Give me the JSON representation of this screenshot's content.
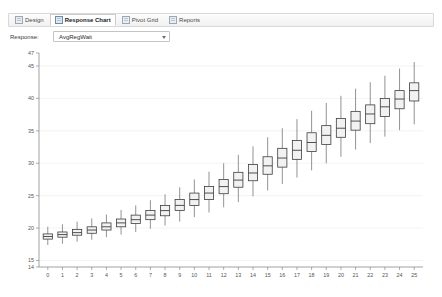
{
  "window": {
    "tabs": [
      {
        "label": "Design",
        "icon": "design-icon",
        "active": false
      },
      {
        "label": "Response Chart",
        "icon": "chart-icon",
        "active": true
      },
      {
        "label": "Pivot Grid",
        "icon": "grid-icon",
        "active": false
      },
      {
        "label": "Reports",
        "icon": "report-icon",
        "active": false
      }
    ]
  },
  "controls": {
    "response_label": "Response:",
    "response_value": "AvgRegWait",
    "dropdown_icon": "chevron-down-icon"
  },
  "chart_data": {
    "type": "box",
    "title": "",
    "xlabel": "",
    "ylabel": "",
    "xlim": [
      -0.6,
      25.6
    ],
    "ylim": [
      14,
      47
    ],
    "grid": true,
    "legend": "none",
    "y_ticks": [
      14,
      15,
      20,
      25,
      30,
      35,
      40,
      45,
      47
    ],
    "y_major_ticks": [
      15,
      20,
      25,
      30,
      35,
      40,
      45
    ],
    "x_ticks": [
      0,
      1,
      2,
      3,
      4,
      5,
      6,
      7,
      8,
      9,
      10,
      11,
      12,
      13,
      14,
      15,
      16,
      17,
      18,
      19,
      20,
      21,
      22,
      23,
      24,
      25
    ],
    "categories": [
      "0",
      "1",
      "2",
      "3",
      "4",
      "5",
      "6",
      "7",
      "8",
      "9",
      "10",
      "11",
      "12",
      "13",
      "14",
      "15",
      "16",
      "17",
      "18",
      "19",
      "20",
      "21",
      "22",
      "23",
      "24",
      "25"
    ],
    "boxes": [
      {
        "x": 0,
        "low": 17.4,
        "q1": 18.3,
        "median": 18.7,
        "q3": 19.1,
        "high": 20.2
      },
      {
        "x": 1,
        "low": 17.6,
        "q1": 18.6,
        "median": 19.0,
        "q3": 19.4,
        "high": 20.6
      },
      {
        "x": 2,
        "low": 17.9,
        "q1": 18.9,
        "median": 19.3,
        "q3": 19.8,
        "high": 21.0
      },
      {
        "x": 3,
        "low": 18.2,
        "q1": 19.2,
        "median": 19.7,
        "q3": 20.2,
        "high": 21.5
      },
      {
        "x": 4,
        "low": 18.6,
        "q1": 19.7,
        "median": 20.2,
        "q3": 20.8,
        "high": 22.1
      },
      {
        "x": 5,
        "low": 19.0,
        "q1": 20.2,
        "median": 20.8,
        "q3": 21.4,
        "high": 22.8
      },
      {
        "x": 6,
        "low": 19.4,
        "q1": 20.7,
        "median": 21.3,
        "q3": 22.0,
        "high": 23.5
      },
      {
        "x": 7,
        "low": 19.9,
        "q1": 21.3,
        "median": 22.0,
        "q3": 22.7,
        "high": 24.3
      },
      {
        "x": 8,
        "low": 20.4,
        "q1": 21.9,
        "median": 22.7,
        "q3": 23.5,
        "high": 25.2
      },
      {
        "x": 9,
        "low": 21.0,
        "q1": 22.7,
        "median": 23.5,
        "q3": 24.4,
        "high": 26.3
      },
      {
        "x": 10,
        "low": 21.7,
        "q1": 23.5,
        "median": 24.4,
        "q3": 25.4,
        "high": 27.5
      },
      {
        "x": 11,
        "low": 22.4,
        "q1": 24.4,
        "median": 25.4,
        "q3": 26.4,
        "high": 28.7
      },
      {
        "x": 12,
        "low": 23.2,
        "q1": 25.3,
        "median": 26.4,
        "q3": 27.5,
        "high": 30.0
      },
      {
        "x": 13,
        "low": 24.0,
        "q1": 26.3,
        "median": 27.4,
        "q3": 28.6,
        "high": 31.3
      },
      {
        "x": 14,
        "low": 24.9,
        "q1": 27.3,
        "median": 28.5,
        "q3": 29.8,
        "high": 32.6
      },
      {
        "x": 15,
        "low": 25.8,
        "q1": 28.3,
        "median": 29.6,
        "q3": 31.0,
        "high": 34.0
      },
      {
        "x": 16,
        "low": 26.8,
        "q1": 29.4,
        "median": 30.8,
        "q3": 32.3,
        "high": 35.4
      },
      {
        "x": 17,
        "low": 27.8,
        "q1": 30.6,
        "median": 32.0,
        "q3": 33.5,
        "high": 36.8
      },
      {
        "x": 18,
        "low": 28.9,
        "q1": 31.8,
        "median": 33.2,
        "q3": 34.7,
        "high": 38.1
      },
      {
        "x": 19,
        "low": 30.0,
        "q1": 32.9,
        "median": 34.3,
        "q3": 35.8,
        "high": 39.3
      },
      {
        "x": 20,
        "low": 31.0,
        "q1": 34.0,
        "median": 35.4,
        "q3": 36.9,
        "high": 40.4
      },
      {
        "x": 21,
        "low": 32.1,
        "q1": 35.1,
        "median": 36.5,
        "q3": 38.0,
        "high": 41.5
      },
      {
        "x": 22,
        "low": 33.1,
        "q1": 36.1,
        "median": 37.6,
        "q3": 39.0,
        "high": 42.5
      },
      {
        "x": 23,
        "low": 34.1,
        "q1": 37.2,
        "median": 38.7,
        "q3": 40.0,
        "high": 43.5
      },
      {
        "x": 24,
        "low": 35.1,
        "q1": 38.4,
        "median": 39.9,
        "q3": 41.2,
        "high": 44.6
      },
      {
        "x": 25,
        "low": 36.0,
        "q1": 39.6,
        "median": 41.2,
        "q3": 42.4,
        "high": 45.6
      }
    ]
  }
}
